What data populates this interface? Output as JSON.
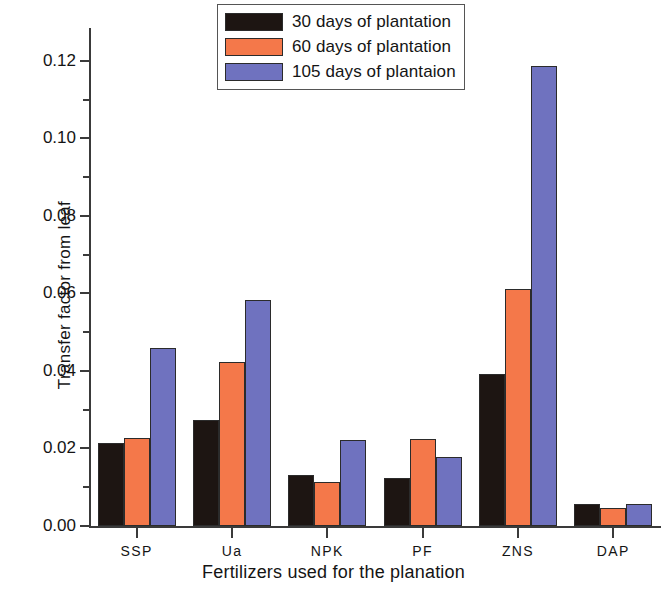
{
  "chart_data": {
    "type": "bar",
    "title": "",
    "subtitle": "",
    "xlabel": "Fertilizers  used for the planation",
    "ylabel": "Transfer factor from leaf",
    "categories": [
      "SSP",
      "Ua",
      "NPK",
      "PF",
      "ZNS",
      "DAP"
    ],
    "series": [
      {
        "name": "30 days of plantation",
        "color": "#1d1512",
        "values": [
          0.0213,
          0.0274,
          0.0132,
          0.0125,
          0.0391,
          0.0057
        ]
      },
      {
        "name": "60 days of plantation",
        "color": "#f4784a",
        "values": [
          0.0226,
          0.0423,
          0.0114,
          0.0225,
          0.0612,
          0.0047
        ]
      },
      {
        "name": "105 days of plantaion",
        "color": "#6f72bf",
        "values": [
          0.0459,
          0.0583,
          0.0221,
          0.0177,
          0.1187,
          0.0058
        ]
      }
    ],
    "ylim": [
      0.0,
      0.1285
    ],
    "ymajor_ticks": [
      "0.00",
      "0.02",
      "0.04",
      "0.06",
      "0.08",
      "0.10",
      "0.12"
    ],
    "ymajor_values": [
      0.0,
      0.02,
      0.04,
      0.06,
      0.08,
      0.1,
      0.12
    ],
    "yminor_values": [
      0.01,
      0.03,
      0.05,
      0.07,
      0.09,
      0.11
    ],
    "grid": false,
    "legend_position": "top-center"
  },
  "legend": {
    "items": [
      {
        "label": "30 days of plantation"
      },
      {
        "label": "60 days of plantation"
      },
      {
        "label": "105 days of plantaion"
      }
    ]
  }
}
